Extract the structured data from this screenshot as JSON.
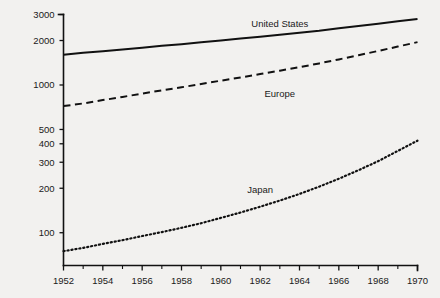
{
  "chart_data": {
    "type": "line",
    "title": "",
    "subtitle": "",
    "xlabel": "",
    "ylabel": "",
    "yscale": "log",
    "xlim": [
      1952,
      1970
    ],
    "ylim": [
      60,
      3000
    ],
    "grid": false,
    "legend_position": "inline-labels",
    "y_ticks": [
      100,
      200,
      300,
      400,
      500,
      1000,
      2000,
      3000
    ],
    "y_tick_labels": [
      "100",
      "200",
      "300",
      "400",
      "500",
      "1000",
      "2000",
      "3000"
    ],
    "x_ticks": [
      1952,
      1954,
      1956,
      1958,
      1960,
      1962,
      1964,
      1966,
      1968,
      1970
    ],
    "x_tick_labels": [
      "1952",
      "1954",
      "1956",
      "1958",
      "1960",
      "1962",
      "1964",
      "1966",
      "1968",
      "1970"
    ],
    "x_minor_ticks": [
      1953,
      1955,
      1957,
      1959,
      1961,
      1963,
      1965,
      1967,
      1969
    ],
    "x": [
      1952,
      1953,
      1954,
      1955,
      1956,
      1957,
      1958,
      1959,
      1960,
      1961,
      1962,
      1963,
      1964,
      1965,
      1966,
      1967,
      1968,
      1969,
      1970
    ],
    "series": [
      {
        "name": "United States",
        "style": "solid",
        "label_x": 1963,
        "label_y": 2450,
        "values": [
          1600,
          1650,
          1690,
          1740,
          1790,
          1840,
          1890,
          1950,
          2000,
          2060,
          2120,
          2190,
          2260,
          2330,
          2420,
          2510,
          2600,
          2700,
          2800
        ]
      },
      {
        "name": "Europe",
        "style": "dashed",
        "label_x": 1963,
        "label_y": 830,
        "values": [
          720,
          750,
          790,
          830,
          875,
          920,
          965,
          1015,
          1070,
          1125,
          1185,
          1250,
          1320,
          1400,
          1490,
          1590,
          1700,
          1820,
          1950
        ]
      },
      {
        "name": "Japan",
        "style": "dotted",
        "label_x": 1962,
        "label_y": 185,
        "values": [
          75,
          79,
          84,
          89,
          95,
          101,
          108,
          116,
          126,
          137,
          150,
          165,
          183,
          205,
          232,
          265,
          305,
          358,
          420
        ]
      }
    ]
  }
}
